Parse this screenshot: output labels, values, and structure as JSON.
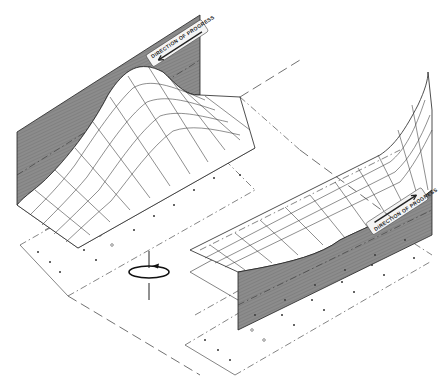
{
  "figure": {
    "type": "isometric technical illustration",
    "background": "#ffffff",
    "wall_color": "#8a8a8a",
    "line_color": "#222222"
  },
  "panels": [
    {
      "id": "upper-left",
      "label": "DIRECTION OF PROGRESS",
      "arrow_direction": "left-down"
    },
    {
      "id": "lower-right",
      "label": "DIRECTION OF PROGRESS",
      "arrow_direction": "right-up"
    }
  ],
  "symbols": {
    "rotation": "rotation-axis-icon"
  }
}
